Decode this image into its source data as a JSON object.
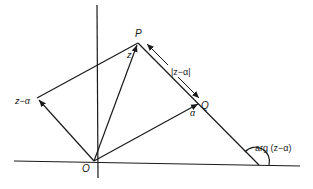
{
  "diagram": {
    "labels": {
      "origin": "O",
      "point_p": "P",
      "point_q": "Q",
      "vector_z": "z",
      "vector_alpha": "α",
      "vector_z_minus_alpha": "z−α",
      "modulus": "|z−α|",
      "argument": "arg (z−α)"
    },
    "colors": {
      "stroke": "#1a1a1a",
      "background": "#ffffff"
    }
  }
}
